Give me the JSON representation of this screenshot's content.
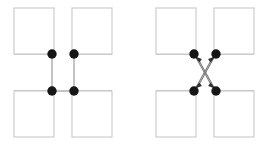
{
  "figure": {
    "type": "node-link-diagram-pair",
    "canvas": {
      "width": 279,
      "height": 150,
      "background": "#ffffff"
    },
    "style": {
      "square_stroke": "#c8c8c8",
      "square_stroke_width": 1.1,
      "square_fill": "#ffffff",
      "node_fill": "#161616",
      "node_radius": 4.7,
      "edge_stroke": "#9a9a9a",
      "edge_stroke_width": 1.1,
      "arrow_stroke": "#6f6f6f",
      "arrow_head_fill": "#2a2a2a"
    },
    "geometry": {
      "square_width": 40,
      "square_height": 46,
      "squares_left_panel": [
        {
          "name": "top-left-square",
          "x": 14,
          "y": 8,
          "w": 40,
          "h": 46
        },
        {
          "name": "top-right-square",
          "x": 72,
          "y": 8,
          "w": 40,
          "h": 46
        },
        {
          "name": "bottom-left-square",
          "x": 14,
          "y": 91,
          "w": 40,
          "h": 46
        },
        {
          "name": "bottom-right-square",
          "x": 72,
          "y": 91,
          "w": 40,
          "h": 46
        }
      ],
      "nodes_left_panel": [
        {
          "name": "node-top-left",
          "cx": 52,
          "cy": 54
        },
        {
          "name": "node-top-right",
          "cx": 74,
          "cy": 54
        },
        {
          "name": "node-bottom-left",
          "cx": 52,
          "cy": 91
        },
        {
          "name": "node-bottom-right",
          "cx": 74,
          "cy": 91
        }
      ],
      "squares_right_panel": [
        {
          "name": "top-left-square",
          "x": 16,
          "y": 8,
          "w": 40,
          "h": 46
        },
        {
          "name": "top-right-square",
          "x": 74,
          "y": 8,
          "w": 40,
          "h": 46
        },
        {
          "name": "bottom-left-square",
          "x": 16,
          "y": 91,
          "w": 40,
          "h": 46
        },
        {
          "name": "bottom-right-square",
          "x": 74,
          "y": 91,
          "w": 40,
          "h": 46
        }
      ],
      "nodes_right_panel": [
        {
          "name": "node-top-left",
          "cx": 54,
          "cy": 54
        },
        {
          "name": "node-top-right",
          "cx": 76,
          "cy": 54
        },
        {
          "name": "node-bottom-left",
          "cx": 54,
          "cy": 91
        },
        {
          "name": "node-bottom-right",
          "cx": 76,
          "cy": 91
        }
      ]
    },
    "panels": [
      {
        "id": "left",
        "name": "left-diagram",
        "edge_style": "plain-line",
        "edges": [
          {
            "name": "edge-top-left-to-bottom-left",
            "from": "node-top-left",
            "to": "node-bottom-left",
            "orientation": "vertical"
          },
          {
            "name": "edge-top-right-to-bottom-right",
            "from": "node-top-right",
            "to": "node-bottom-right",
            "orientation": "vertical"
          },
          {
            "name": "edge-bottom-left-to-bottom-right",
            "from": "node-bottom-left",
            "to": "node-bottom-right",
            "orientation": "horizontal"
          }
        ],
        "stub_lines": [
          {
            "name": "stub-top-left-up",
            "x1": 52,
            "y1": 42,
            "x2": 52,
            "y2": 54
          },
          {
            "name": "stub-top-right-right",
            "x1": 74,
            "y1": 54,
            "x2": 112,
            "y2": 54
          },
          {
            "name": "stub-top-left-left",
            "x1": 14,
            "y1": 54,
            "x2": 52,
            "y2": 54
          },
          {
            "name": "stub-top-right-up",
            "x1": 74,
            "y1": 42,
            "x2": 74,
            "y2": 54
          },
          {
            "name": "stub-bottom-left-left",
            "x1": 14,
            "y1": 91,
            "x2": 52,
            "y2": 91
          },
          {
            "name": "stub-bottom-right-right",
            "x1": 76,
            "y1": 91,
            "x2": 112,
            "y2": 91
          },
          {
            "name": "stub-bottom-left-down",
            "x1": 52,
            "y1": 91,
            "x2": 52,
            "y2": 101
          },
          {
            "name": "stub-bottom-right-down",
            "x1": 74,
            "y1": 91,
            "x2": 74,
            "y2": 101
          }
        ]
      },
      {
        "id": "right",
        "name": "right-diagram",
        "edge_style": "diagonal-arrow",
        "edges": [
          {
            "name": "arrow-bottom-right-to-top-left",
            "from": "node-bottom-right",
            "to": "node-top-left",
            "orientation": "diagonal"
          },
          {
            "name": "arrow-bottom-left-to-top-right",
            "from": "node-bottom-left",
            "to": "node-top-right",
            "orientation": "diagonal"
          },
          {
            "name": "arrow-top-right-to-bottom-left",
            "from": "node-top-right",
            "to": "node-bottom-left",
            "orientation": "diagonal"
          },
          {
            "name": "arrow-top-left-to-bottom-right",
            "from": "node-top-left",
            "to": "node-bottom-right",
            "orientation": "diagonal"
          }
        ],
        "stub_lines": [
          {
            "name": "stub-top-left-left",
            "x1": 16,
            "y1": 54,
            "x2": 54,
            "y2": 54
          },
          {
            "name": "stub-top-left-up",
            "x1": 54,
            "y1": 42,
            "x2": 54,
            "y2": 54
          },
          {
            "name": "stub-top-right-right",
            "x1": 76,
            "y1": 54,
            "x2": 114,
            "y2": 54
          },
          {
            "name": "stub-top-right-up",
            "x1": 76,
            "y1": 42,
            "x2": 76,
            "y2": 54
          },
          {
            "name": "stub-bottom-left-left",
            "x1": 16,
            "y1": 91,
            "x2": 54,
            "y2": 91
          },
          {
            "name": "stub-bottom-left-down",
            "x1": 54,
            "y1": 91,
            "x2": 54,
            "y2": 101
          },
          {
            "name": "stub-bottom-right-right",
            "x1": 76,
            "y1": 91,
            "x2": 114,
            "y2": 91
          },
          {
            "name": "stub-bottom-right-down",
            "x1": 76,
            "y1": 91,
            "x2": 76,
            "y2": 101
          }
        ]
      }
    ]
  }
}
